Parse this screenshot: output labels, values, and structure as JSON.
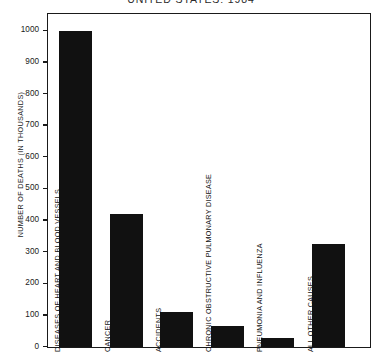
{
  "chart_data": {
    "type": "bar",
    "title": "UNITED STATES: 1984",
    "xlabel": "",
    "ylabel": "NUMBER OF DEATHS (IN THOUSANDS)",
    "ylim": [
      0,
      1050
    ],
    "yticks": [
      0,
      100,
      200,
      300,
      400,
      500,
      600,
      700,
      800,
      900,
      1000
    ],
    "ytick_labels": [
      "0",
      "100",
      "200",
      "300",
      "400",
      "500",
      "600",
      "700",
      "800",
      "900",
      "1000"
    ],
    "grid": false,
    "legend": null,
    "bar_color": "#111111",
    "frame_color": "#1a1a1a",
    "categories": [
      "DISEASES OF HEART AND BLOOD VESSELS",
      "CANCER",
      "ACCIDENTS",
      "CHRONIC OBSTRUCTIVE PULMONARY DISEASE",
      "PNEUMONIA AND INFLUENZA",
      "ALL OTHER CAUSES"
    ],
    "values": [
      1000,
      420,
      110,
      68,
      28,
      325
    ]
  }
}
